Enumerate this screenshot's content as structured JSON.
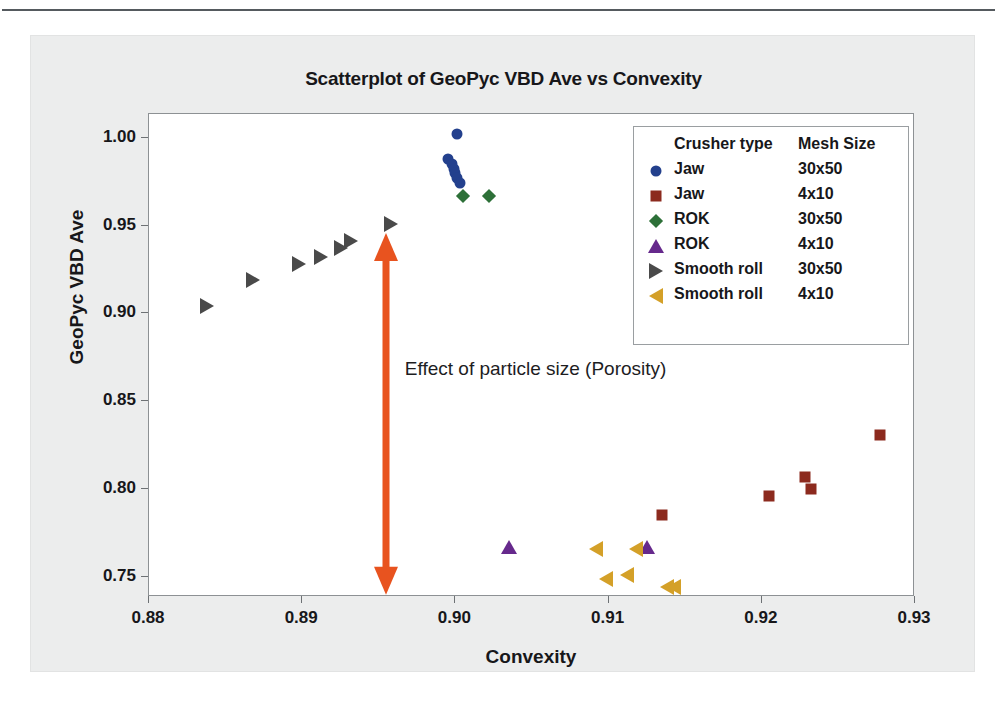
{
  "chart_data": {
    "type": "scatter",
    "title": "Scatterplot of GeoPyc VBD Ave vs Convexity",
    "xlabel": "Convexity",
    "ylabel": "GeoPyc VBD Ave",
    "xlim": [
      0.88,
      0.93
    ],
    "ylim": [
      0.7385,
      1.0135
    ],
    "xticks": [
      "0.88",
      "0.89",
      "0.90",
      "0.91",
      "0.92",
      "0.93"
    ],
    "xtick_values": [
      0.88,
      0.89,
      0.9,
      0.91,
      0.92,
      0.93
    ],
    "yticks": [
      "0.75",
      "0.80",
      "0.85",
      "0.90",
      "0.95",
      "1.00"
    ],
    "ytick_values": [
      0.75,
      0.8,
      0.85,
      0.9,
      0.95,
      1.0
    ],
    "grid": false,
    "legend_position": "upper right",
    "legend_headers": [
      "Crusher type",
      "Mesh Size"
    ],
    "series": [
      {
        "name": "Jaw 30x50",
        "crusher_type": "Jaw",
        "mesh_size": "30x50",
        "marker": "circle",
        "color": "#23408d",
        "points": [
          {
            "x": 0.9001,
            "y": 1.002
          },
          {
            "x": 0.8995,
            "y": 0.988
          },
          {
            "x": 0.8998,
            "y": 0.985
          },
          {
            "x": 0.8999,
            "y": 0.982
          },
          {
            "x": 0.9,
            "y": 0.98
          },
          {
            "x": 0.9001,
            "y": 0.977
          },
          {
            "x": 0.9003,
            "y": 0.974
          }
        ]
      },
      {
        "name": "Jaw 4x10",
        "crusher_type": "Jaw",
        "mesh_size": "4x10",
        "marker": "square",
        "color": "#8c2a1e",
        "points": [
          {
            "x": 0.9135,
            "y": 0.785
          },
          {
            "x": 0.9205,
            "y": 0.796
          },
          {
            "x": 0.9228,
            "y": 0.807
          },
          {
            "x": 0.9232,
            "y": 0.8
          },
          {
            "x": 0.9277,
            "y": 0.831
          }
        ]
      },
      {
        "name": "ROK 30x50",
        "crusher_type": "ROK",
        "mesh_size": "30x50",
        "marker": "diamond",
        "color": "#2d7038",
        "points": [
          {
            "x": 0.9005,
            "y": 0.967
          },
          {
            "x": 0.9022,
            "y": 0.967
          }
        ]
      },
      {
        "name": "ROK 4x10",
        "crusher_type": "ROK",
        "mesh_size": "4x10",
        "marker": "triangle-up",
        "color": "#66298c",
        "points": [
          {
            "x": 0.9035,
            "y": 0.767
          },
          {
            "x": 0.9125,
            "y": 0.767
          }
        ]
      },
      {
        "name": "Smooth roll 30x50",
        "crusher_type": "Smooth roll",
        "mesh_size": "30x50",
        "marker": "triangle-right",
        "color": "#4a4a4a",
        "points": [
          {
            "x": 0.8838,
            "y": 0.904
          },
          {
            "x": 0.8868,
            "y": 0.919
          },
          {
            "x": 0.8898,
            "y": 0.928
          },
          {
            "x": 0.8912,
            "y": 0.932
          },
          {
            "x": 0.8925,
            "y": 0.937
          },
          {
            "x": 0.8932,
            "y": 0.941
          },
          {
            "x": 0.8958,
            "y": 0.951
          }
        ]
      },
      {
        "name": "Smooth roll 4x10",
        "crusher_type": "Smooth roll",
        "mesh_size": "4x10",
        "marker": "triangle-left",
        "color": "#d4a028",
        "points": [
          {
            "x": 0.9092,
            "y": 0.766
          },
          {
            "x": 0.9098,
            "y": 0.749
          },
          {
            "x": 0.9112,
            "y": 0.751
          },
          {
            "x": 0.9118,
            "y": 0.766
          },
          {
            "x": 0.9138,
            "y": 0.744
          },
          {
            "x": 0.9143,
            "y": 0.744
          }
        ]
      }
    ],
    "annotations": [
      {
        "text": "Effect of particle size (Porosity)",
        "x": 0.8967,
        "y": 0.867,
        "color": "#1d1d1f"
      },
      {
        "type": "double-arrow",
        "x": 0.8955,
        "y_top": 0.9455,
        "y_bottom": 0.7395,
        "color": "#e8531f"
      }
    ]
  },
  "colors": {
    "panel_background": "#eceded",
    "plot_background": "#ffffff",
    "frame": "#8d9194",
    "text": "#17171a",
    "arrow": "#e8531f"
  }
}
